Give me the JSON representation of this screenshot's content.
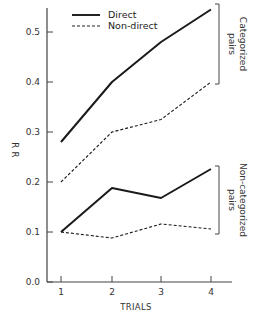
{
  "chart_data": {
    "type": "line",
    "title": "",
    "xlabel": "TRIALS",
    "ylabel": "R R",
    "x": [
      1,
      2,
      3,
      4
    ],
    "categories": [
      "1",
      "2",
      "3",
      "4"
    ],
    "ylim": [
      0.0,
      0.55
    ],
    "yticks": [
      0.0,
      0.1,
      0.2,
      0.3,
      0.4,
      0.5
    ],
    "ytick_labels": [
      "0.0",
      "0.1",
      "0.2",
      "0.3",
      "0.4",
      "0.5"
    ],
    "grid": false,
    "legend_position": "top-left",
    "legend": [
      {
        "name": "Direct",
        "style": "solid"
      },
      {
        "name": "Non-direct",
        "style": "dashed"
      }
    ],
    "series": [
      {
        "name": "Direct (Categorized pairs)",
        "group": "Categorized pairs",
        "style": "solid",
        "values": [
          0.28,
          0.4,
          0.48,
          0.545
        ]
      },
      {
        "name": "Non-direct (Categorized pairs)",
        "group": "Categorized pairs",
        "style": "dashed",
        "values": [
          0.2,
          0.3,
          0.325,
          0.4
        ]
      },
      {
        "name": "Direct (Non-categorized pairs)",
        "group": "Non-categorized pairs",
        "style": "solid",
        "values": [
          0.1,
          0.188,
          0.168,
          0.226
        ]
      },
      {
        "name": "Non-direct (Non-categorized pairs)",
        "group": "Non-categorized pairs",
        "style": "dashed",
        "values": [
          0.1,
          0.088,
          0.116,
          0.106
        ]
      }
    ],
    "annotations": [
      {
        "text": "Categorized pairs",
        "type": "bracket",
        "spans": [
          0.4,
          0.545
        ]
      },
      {
        "text": "Non-categorized pairs",
        "type": "bracket",
        "spans": [
          0.1,
          0.22
        ]
      }
    ]
  },
  "labels": {
    "legend_direct": "Direct",
    "legend_nondirect": "Non-direct",
    "bracket_cat_line1": "Categorized",
    "bracket_cat_line2": "pairs",
    "bracket_noncat_line1": "Non-categorized",
    "bracket_noncat_line2": "pairs"
  }
}
